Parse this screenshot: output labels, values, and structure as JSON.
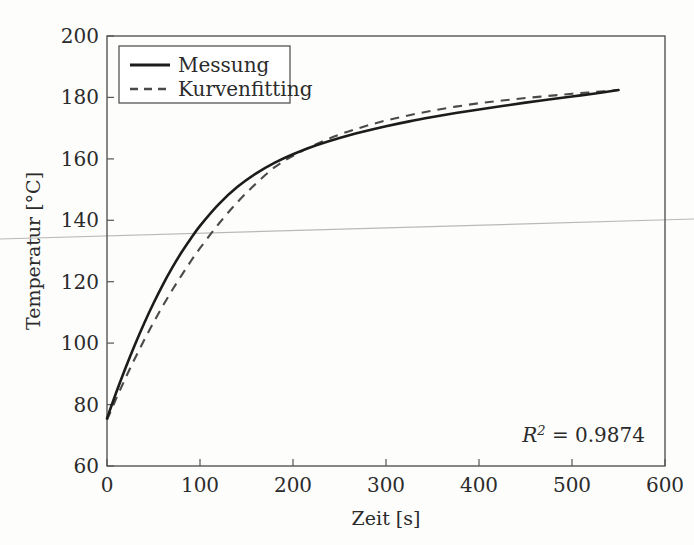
{
  "chart_data": {
    "type": "line",
    "title": "",
    "xlabel": "Zeit [s]",
    "ylabel": "Temperatur [°C]",
    "xlim": [
      0,
      600
    ],
    "ylim": [
      60,
      200
    ],
    "xticks": [
      0,
      100,
      200,
      300,
      400,
      500,
      600
    ],
    "yticks": [
      60,
      80,
      100,
      120,
      140,
      160,
      180,
      200
    ],
    "xtick_labels": [
      "0",
      "100",
      "200",
      "300",
      "400",
      "500",
      "600"
    ],
    "ytick_labels": [
      "60",
      "80",
      "100",
      "120",
      "140",
      "160",
      "180",
      "200"
    ],
    "grid": false,
    "legend_position": "top-left",
    "annotation": {
      "symbol": "R",
      "exponent": "2",
      "equals": " = ",
      "value": "0.9874",
      "full_text": "R² = 0.9874"
    },
    "series": [
      {
        "name": "Messung",
        "style": "solid",
        "color": "#1c1c1c",
        "x": [
          0,
          10,
          20,
          30,
          40,
          50,
          60,
          70,
          80,
          90,
          100,
          120,
          140,
          160,
          180,
          200,
          225,
          250,
          275,
          300,
          325,
          350,
          375,
          400,
          425,
          450,
          475,
          500,
          525,
          550
        ],
        "y": [
          75.5,
          84.0,
          92.0,
          99.5,
          106.5,
          113.0,
          119.0,
          124.5,
          129.5,
          134.0,
          138.2,
          145.2,
          150.8,
          155.2,
          158.7,
          161.5,
          164.4,
          166.8,
          168.8,
          170.6,
          172.2,
          173.6,
          174.9,
          176.1,
          177.2,
          178.3,
          179.3,
          180.3,
          181.3,
          182.4
        ]
      },
      {
        "name": "Kurvenfitting",
        "style": "dashed",
        "color": "#4a4a4a",
        "x": [
          0,
          10,
          20,
          30,
          40,
          50,
          60,
          70,
          80,
          90,
          100,
          120,
          140,
          160,
          180,
          200,
          225,
          250,
          275,
          300,
          325,
          350,
          375,
          400,
          425,
          450,
          475,
          500,
          525,
          550
        ],
        "y": [
          75.0,
          82.0,
          88.7,
          95.0,
          101.0,
          106.7,
          112.1,
          117.2,
          122.0,
          126.6,
          130.9,
          138.8,
          145.8,
          151.9,
          157.2,
          161.0,
          164.8,
          167.9,
          170.4,
          172.5,
          174.2,
          175.7,
          177.0,
          178.1,
          179.0,
          179.8,
          180.5,
          181.2,
          181.8,
          182.4
        ]
      }
    ]
  },
  "legend": {
    "entries": [
      {
        "label": "Messung"
      },
      {
        "label": "Kurvenfitting"
      }
    ]
  }
}
